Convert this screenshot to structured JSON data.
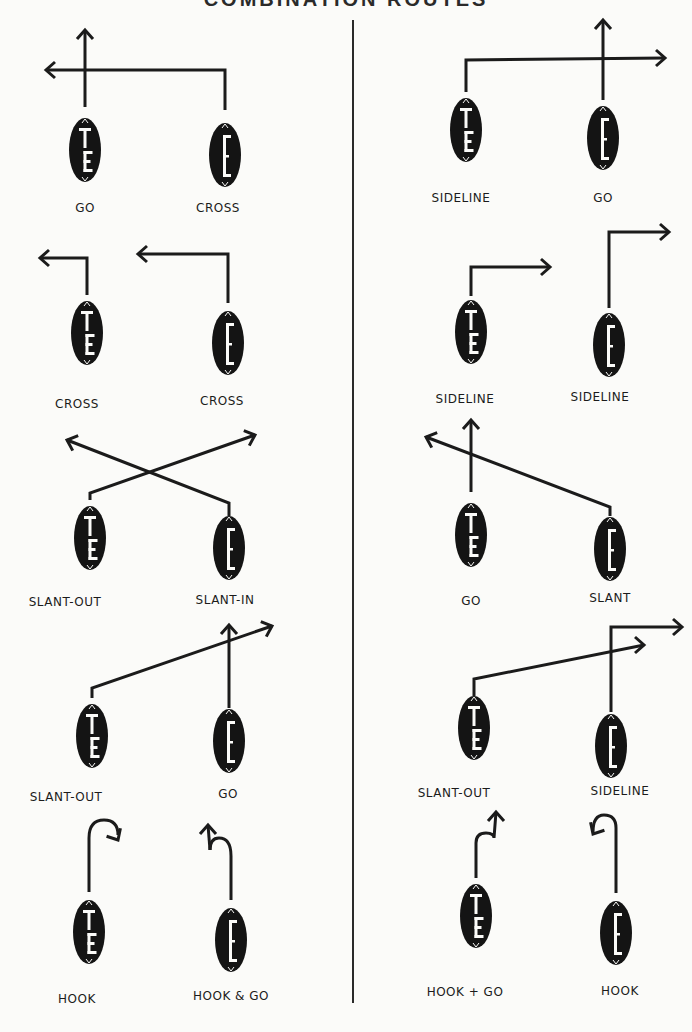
{
  "title": "COMBINATION ROUTES",
  "divider": {
    "x": 353,
    "y1": 20,
    "y2": 1003
  },
  "players": {
    "TE": {
      "label": "TE",
      "position": "Tight End"
    },
    "E": {
      "label": "E",
      "position": "End"
    }
  },
  "combinations": [
    {
      "column": "left",
      "row": 1,
      "routes": [
        {
          "player": "TE",
          "name": "GO",
          "ball": [
            85,
            150
          ],
          "label_pos": [
            85,
            212
          ],
          "path": "M85,107 L85,30",
          "arrow": {
            "at": [
              85,
              30
            ],
            "dir": "up"
          }
        },
        {
          "player": "E",
          "name": "CROSS",
          "ball": [
            225,
            155
          ],
          "label_pos": [
            218,
            212
          ],
          "path": "M225,110 L225,70 L46,70",
          "arrow": {
            "at": [
              46,
              70
            ],
            "dir": "left"
          }
        }
      ]
    },
    {
      "column": "right",
      "row": 1,
      "routes": [
        {
          "player": "TE",
          "name": "SIDELINE",
          "ball": [
            466,
            130
          ],
          "label_pos": [
            461,
            202
          ],
          "path": "M466,92 L466,60 L665,58",
          "arrow": {
            "at": [
              665,
              58
            ],
            "dir": "right"
          }
        },
        {
          "player": "E",
          "name": "GO",
          "ball": [
            603,
            138
          ],
          "label_pos": [
            603,
            202
          ],
          "path": "M603,100 L603,20",
          "arrow": {
            "at": [
              603,
              20
            ],
            "dir": "up"
          }
        }
      ]
    },
    {
      "column": "left",
      "row": 2,
      "routes": [
        {
          "player": "TE",
          "name": "CROSS",
          "ball": [
            87,
            333
          ],
          "label_pos": [
            77,
            408
          ],
          "path": "M87,295 L87,258 L40,258",
          "arrow": {
            "at": [
              40,
              258
            ],
            "dir": "left"
          }
        },
        {
          "player": "E",
          "name": "CROSS",
          "ball": [
            228,
            343
          ],
          "label_pos": [
            222,
            405
          ],
          "path": "M228,303 L228,254 L138,254",
          "arrow": {
            "at": [
              138,
              254
            ],
            "dir": "left"
          }
        }
      ]
    },
    {
      "column": "right",
      "row": 2,
      "routes": [
        {
          "player": "TE",
          "name": "SIDELINE",
          "ball": [
            471,
            332
          ],
          "label_pos": [
            465,
            403
          ],
          "path": "M471,296 L471,267 L550,267",
          "arrow": {
            "at": [
              550,
              267
            ],
            "dir": "right"
          }
        },
        {
          "player": "E",
          "name": "SIDELINE",
          "ball": [
            609,
            345
          ],
          "label_pos": [
            600,
            401
          ],
          "path": "M609,308 L609,232 L669,232",
          "arrow": {
            "at": [
              669,
              232
            ],
            "dir": "right"
          }
        }
      ]
    },
    {
      "column": "left",
      "row": 3,
      "routes": [
        {
          "player": "TE",
          "name": "SLANT-OUT",
          "ball": [
            90,
            538
          ],
          "label_pos": [
            65,
            606
          ],
          "path": "M90,500 L90,493 L255,435",
          "arrow": {
            "at": [
              255,
              435
            ],
            "dir": "up-right"
          }
        },
        {
          "player": "E",
          "name": "SLANT-IN",
          "ball": [
            229,
            548
          ],
          "label_pos": [
            225,
            604
          ],
          "path": "M229,516 L229,503 L67,440",
          "arrow": {
            "at": [
              67,
              440
            ],
            "dir": "up-left"
          }
        }
      ]
    },
    {
      "column": "right",
      "row": 3,
      "routes": [
        {
          "player": "TE",
          "name": "GO",
          "ball": [
            471,
            535
          ],
          "label_pos": [
            471,
            605
          ],
          "path": "M471,492 L471,420",
          "arrow": {
            "at": [
              471,
              420
            ],
            "dir": "up"
          }
        },
        {
          "player": "E",
          "name": "SLANT",
          "ball": [
            610,
            549
          ],
          "label_pos": [
            610,
            602
          ],
          "path": "M610,516 L610,507 L426,437",
          "arrow": {
            "at": [
              426,
              437
            ],
            "dir": "up-left"
          }
        }
      ]
    },
    {
      "column": "left",
      "row": 4,
      "routes": [
        {
          "player": "TE",
          "name": "SLANT-OUT",
          "ball": [
            92,
            736
          ],
          "label_pos": [
            66,
            801
          ],
          "path": "M92,698 L92,688 L272,626",
          "arrow": {
            "at": [
              272,
              626
            ],
            "dir": "up-right"
          }
        },
        {
          "player": "E",
          "name": "GO",
          "ball": [
            229,
            741
          ],
          "label_pos": [
            228,
            798
          ],
          "path": "M229,708 L229,625",
          "arrow": {
            "at": [
              229,
              625
            ],
            "dir": "up"
          }
        }
      ]
    },
    {
      "column": "right",
      "row": 4,
      "routes": [
        {
          "player": "TE",
          "name": "SLANT-OUT",
          "ball": [
            474,
            728
          ],
          "label_pos": [
            454,
            797
          ],
          "path": "M474,696 L474,679 L644,645",
          "arrow": {
            "at": [
              644,
              645
            ],
            "dir": "right"
          }
        },
        {
          "player": "E",
          "name": "SIDELINE",
          "ball": [
            611,
            746
          ],
          "label_pos": [
            620,
            795
          ],
          "path": "M611,712 L611,627 L682,627",
          "arrow": {
            "at": [
              682,
              627
            ],
            "dir": "right"
          }
        }
      ]
    },
    {
      "column": "left",
      "row": 5,
      "routes": [
        {
          "player": "TE",
          "name": "HOOK",
          "ball": [
            89,
            932
          ],
          "label_pos": [
            77,
            1003
          ],
          "path": "M89,892 L89,838 Q89,820 104,820 Q118,820 118,835",
          "arrow": {
            "at": [
              118,
              840
            ],
            "dir": "down-right"
          }
        },
        {
          "player": "E",
          "name": "HOOK & GO",
          "ball": [
            231,
            940
          ],
          "label_pos": [
            231,
            1000
          ],
          "path": "M231,900 L231,856 Q231,838 219,838 Q210,838 210,850",
          "arrow": {
            "at": [
              208,
              825
            ],
            "dir": "up"
          },
          "extra_path": "M210,850 L208,825"
        }
      ]
    },
    {
      "column": "right",
      "row": 5,
      "routes": [
        {
          "player": "TE",
          "name": "HOOK + GO",
          "ball": [
            476,
            916
          ],
          "label_pos": [
            465,
            996
          ],
          "path": "M476,878 L476,843 Q476,833 486,833 Q494,833 494,838 L496,812",
          "arrow": {
            "at": [
              496,
              812
            ],
            "dir": "up"
          }
        },
        {
          "player": "E",
          "name": "HOOK",
          "ball": [
            616,
            933
          ],
          "label_pos": [
            620,
            995
          ],
          "path": "M616,893 L616,828 Q616,815 604,815 Q593,815 593,832",
          "arrow": {
            "at": [
              593,
              834
            ],
            "dir": "down-left"
          }
        }
      ]
    }
  ]
}
